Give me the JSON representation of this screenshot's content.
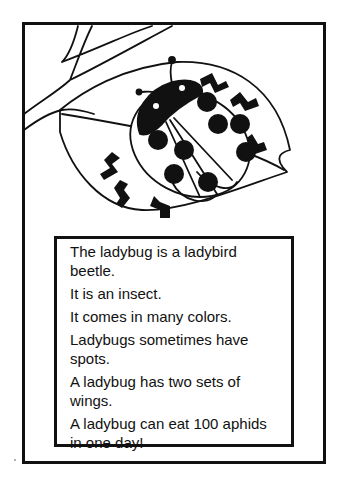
{
  "worksheet": {
    "illustration": {
      "subject": "ladybug-on-leaf",
      "alt": "Line drawing of a spotted ladybug resting on a leaf attached to a branch"
    },
    "facts": [
      "The ladybug is a ladybird beetle.",
      "It is an insect.",
      "It comes in many colors.",
      "Ladybugs sometimes have spots.",
      "A ladybug has two sets of wings.",
      "A ladybug can eat 100 aphids in one day!"
    ]
  }
}
